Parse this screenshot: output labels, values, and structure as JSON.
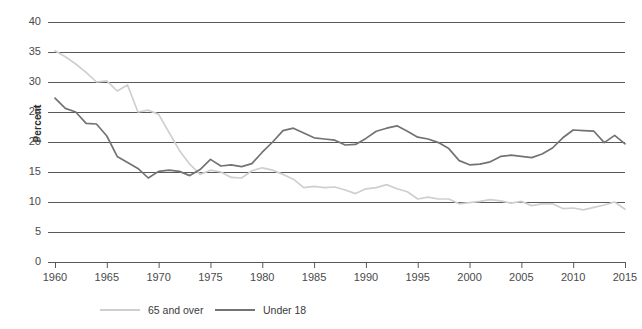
{
  "chart_data": {
    "type": "line",
    "title": "",
    "xlabel": "",
    "ylabel": "Percent",
    "xlim": [
      1960,
      2015
    ],
    "ylim": [
      0,
      40
    ],
    "ytick_step": 5,
    "xtick_step": 5,
    "grid": "horizontal",
    "legend_position": "bottom",
    "yticks": [
      "0",
      "5",
      "10",
      "15",
      "20",
      "25",
      "30",
      "35",
      "40"
    ],
    "xticks": [
      "1960",
      "1965",
      "1970",
      "1975",
      "1980",
      "1985",
      "1990",
      "1995",
      "2000",
      "2005",
      "2010",
      "2015"
    ],
    "x": [
      1960,
      1961,
      1962,
      1963,
      1964,
      1965,
      1966,
      1967,
      1968,
      1969,
      1970,
      1971,
      1972,
      1973,
      1974,
      1975,
      1976,
      1977,
      1978,
      1979,
      1980,
      1981,
      1982,
      1983,
      1984,
      1985,
      1986,
      1987,
      1988,
      1989,
      1990,
      1991,
      1992,
      1993,
      1994,
      1995,
      1996,
      1997,
      1998,
      1999,
      2000,
      2001,
      2002,
      2003,
      2004,
      2005,
      2006,
      2007,
      2008,
      2009,
      2010,
      2011,
      2012,
      2013,
      2014,
      2015
    ],
    "series": [
      {
        "name": "65 and over",
        "color": "#cfcfcf",
        "values": [
          35.2,
          34.2,
          33.0,
          31.6,
          30.0,
          30.2,
          28.5,
          29.5,
          25.0,
          25.3,
          24.6,
          21.6,
          18.6,
          16.3,
          14.6,
          15.3,
          15.0,
          14.1,
          14.0,
          15.2,
          15.7,
          15.3,
          14.6,
          13.8,
          12.4,
          12.6,
          12.4,
          12.5,
          12.0,
          11.4,
          12.2,
          12.4,
          12.9,
          12.2,
          11.7,
          10.5,
          10.8,
          10.5,
          10.5,
          9.7,
          9.9,
          10.1,
          10.4,
          10.2,
          9.8,
          10.1,
          9.4,
          9.7,
          9.7,
          8.9,
          9.0,
          8.7,
          9.1,
          9.5,
          10.0,
          8.8
        ]
      },
      {
        "name": "Under 18",
        "color": "#737373",
        "values": [
          27.3,
          25.6,
          25.0,
          23.1,
          23.0,
          21.0,
          17.6,
          16.6,
          15.6,
          14.0,
          15.1,
          15.3,
          15.1,
          14.4,
          15.4,
          17.1,
          16.0,
          16.2,
          15.9,
          16.4,
          18.3,
          20.0,
          21.9,
          22.3,
          21.5,
          20.7,
          20.5,
          20.3,
          19.5,
          19.6,
          20.6,
          21.8,
          22.3,
          22.7,
          21.8,
          20.8,
          20.5,
          19.9,
          18.9,
          16.9,
          16.2,
          16.3,
          16.7,
          17.6,
          17.8,
          17.6,
          17.4,
          18.0,
          19.0,
          20.7,
          22.0,
          21.9,
          21.8,
          19.9,
          21.1,
          19.7
        ]
      }
    ]
  },
  "axes": {
    "ylabel_text": "Percent"
  },
  "legend": {
    "items": [
      {
        "label": "65 and over",
        "color": "#cfcfcf"
      },
      {
        "label": "Under 18",
        "color": "#737373"
      }
    ]
  }
}
